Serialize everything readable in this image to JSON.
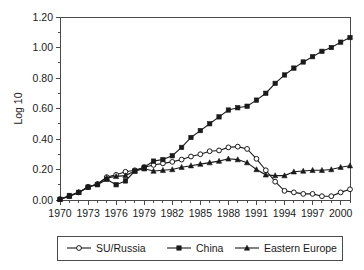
{
  "chart_data": {
    "type": "line",
    "title": "",
    "xlabel": "",
    "ylabel": "Log 10",
    "xlim": [
      1970,
      2001
    ],
    "ylim": [
      0.0,
      1.2
    ],
    "grid": false,
    "legend_position": "bottom",
    "y_ticks": [
      "0.00",
      "0.20",
      "0.40",
      "0.60",
      "0.80",
      "1.00",
      "1.20"
    ],
    "y_tick_values": [
      0.0,
      0.2,
      0.4,
      0.6,
      0.8,
      1.0,
      1.2
    ],
    "y_minor_step": 0.1,
    "x_ticks": [
      "1970",
      "1973",
      "1976",
      "1979",
      "1982",
      "1985",
      "1988",
      "1991",
      "1994",
      "1997",
      "2000"
    ],
    "x_tick_values": [
      1970,
      1973,
      1976,
      1979,
      1982,
      1985,
      1988,
      1991,
      1994,
      1997,
      2000
    ],
    "x_minor_step": 1,
    "x": [
      1970,
      1971,
      1972,
      1973,
      1974,
      1975,
      1976,
      1977,
      1978,
      1979,
      1980,
      1981,
      1982,
      1983,
      1984,
      1985,
      1986,
      1987,
      1988,
      1989,
      1990,
      1991,
      1992,
      1993,
      1994,
      1995,
      1996,
      1997,
      1998,
      1999,
      2000,
      2001
    ],
    "series": [
      {
        "name": "SU/Russia",
        "marker": "open-circle",
        "values": [
          0.005,
          0.025,
          0.05,
          0.085,
          0.105,
          0.15,
          0.165,
          0.185,
          0.195,
          0.215,
          0.23,
          0.24,
          0.25,
          0.265,
          0.285,
          0.3,
          0.32,
          0.325,
          0.345,
          0.35,
          0.335,
          0.27,
          0.195,
          0.12,
          0.06,
          0.05,
          0.04,
          0.04,
          0.025,
          0.025,
          0.05,
          0.07
        ]
      },
      {
        "name": "China",
        "marker": "filled-square",
        "values": [
          0.005,
          0.03,
          0.05,
          0.085,
          0.1,
          0.135,
          0.1,
          0.125,
          0.19,
          0.215,
          0.255,
          0.265,
          0.29,
          0.345,
          0.41,
          0.455,
          0.5,
          0.545,
          0.59,
          0.605,
          0.615,
          0.655,
          0.7,
          0.765,
          0.82,
          0.865,
          0.905,
          0.94,
          0.975,
          1.0,
          1.035,
          1.065
        ]
      },
      {
        "name": "Eastern Europe",
        "marker": "filled-triangle",
        "values": [
          0.005,
          0.025,
          0.05,
          0.085,
          0.105,
          0.145,
          0.155,
          0.16,
          0.19,
          0.205,
          0.19,
          0.195,
          0.2,
          0.215,
          0.225,
          0.235,
          0.245,
          0.255,
          0.27,
          0.265,
          0.245,
          0.2,
          0.165,
          0.16,
          0.16,
          0.185,
          0.19,
          0.195,
          0.195,
          0.2,
          0.215,
          0.225
        ]
      }
    ]
  },
  "legend": {
    "entries": [
      {
        "label": "SU/Russia",
        "marker": "open-circle"
      },
      {
        "label": "China",
        "marker": "filled-square"
      },
      {
        "label": "Eastern Europe",
        "marker": "filled-triangle"
      }
    ]
  },
  "colors": {
    "ink": "#1a1a1a",
    "axis": "#4a4a4a",
    "background": "#ffffff"
  }
}
